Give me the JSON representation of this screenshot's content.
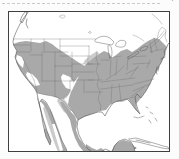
{
  "figure": {
    "kind": "species range map",
    "region": "United States with southern Canada, northern Mexico and Cuba",
    "areas": {
      "eastern_range": "eastern shaded range (Midwest, Northeast, Southeast, Texas)",
      "western_range": "western shaded range (Pacific coast, Great Basin, Rockies, Southwest)",
      "west_texas_patch": "light shaded patch in west Texas / eastern New Mexico",
      "mexico_bands": "shaded bands through Mexico and Baja California",
      "yucatan_patch": "shaded patch on southern Mexico coast",
      "plains_gap": "unshaded Great Plains and northern states"
    },
    "water": [
      "Pacific Ocean",
      "Gulf of Mexico",
      "Atlantic Ocean",
      "Gulf of California",
      "Great Lakes"
    ],
    "islands": [
      "Vancouver Island",
      "Florida Keys",
      "Bahamas",
      "Cuba",
      "Jamaica"
    ]
  },
  "colors": {
    "page_background": "#fcfcfc",
    "land": "#ffffff",
    "range_primary": "#a9a9a9",
    "range_secondary": "#cbcbcb",
    "coastline": "#4d4d4d",
    "state_line": "#6e6e6e",
    "water_outline": "#585858",
    "frame_border": "#3f3f3f",
    "artifact_line": "#c9c9c9",
    "artifact_mark": "#5c5c5c"
  },
  "artifacts": {
    "corner_mark": "’"
  }
}
